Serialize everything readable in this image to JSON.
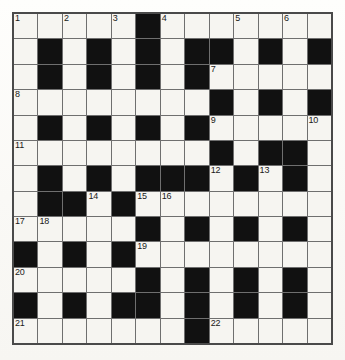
{
  "puzzle": {
    "type": "crossword-grid",
    "title": "Crossword puzzle grid",
    "columns": 13,
    "rows": 13,
    "cell_size_px": 24.6,
    "colors": {
      "block": "#111111",
      "open": "#f6f5f1",
      "grid_line": "#6f6f6f",
      "outer_border": "#4a4a4a",
      "number_text": "#1a1a1a",
      "page_background": "#fbfaf7"
    },
    "legend": {
      "block_symbol": "B",
      "open_symbol": "W"
    },
    "grid": [
      [
        "W",
        "W",
        "W",
        "W",
        "W",
        "B",
        "W",
        "W",
        "W",
        "W",
        "W",
        "W",
        "W"
      ],
      [
        "W",
        "B",
        "W",
        "B",
        "W",
        "B",
        "W",
        "B",
        "B",
        "W",
        "B",
        "W",
        "B"
      ],
      [
        "W",
        "B",
        "W",
        "B",
        "W",
        "B",
        "W",
        "B",
        "W",
        "W",
        "W",
        "W",
        "W"
      ],
      [
        "W",
        "W",
        "W",
        "W",
        "W",
        "W",
        "W",
        "W",
        "B",
        "W",
        "B",
        "W",
        "B"
      ],
      [
        "W",
        "B",
        "W",
        "B",
        "W",
        "B",
        "W",
        "B",
        "W",
        "W",
        "W",
        "W",
        "W"
      ],
      [
        "W",
        "W",
        "W",
        "W",
        "W",
        "W",
        "W",
        "W",
        "B",
        "W",
        "B",
        "B",
        "W"
      ],
      [
        "W",
        "B",
        "W",
        "B",
        "W",
        "B",
        "B",
        "B",
        "W",
        "B",
        "W",
        "B",
        "W"
      ],
      [
        "W",
        "B",
        "B",
        "W",
        "B",
        "W",
        "W",
        "W",
        "W",
        "W",
        "W",
        "W",
        "W"
      ],
      [
        "W",
        "W",
        "W",
        "W",
        "W",
        "B",
        "W",
        "B",
        "W",
        "B",
        "W",
        "B",
        "W"
      ],
      [
        "B",
        "W",
        "B",
        "W",
        "B",
        "W",
        "W",
        "W",
        "W",
        "W",
        "W",
        "W",
        "W"
      ],
      [
        "W",
        "W",
        "W",
        "W",
        "W",
        "B",
        "W",
        "B",
        "W",
        "B",
        "W",
        "B",
        "W"
      ],
      [
        "B",
        "W",
        "B",
        "W",
        "B",
        "B",
        "W",
        "B",
        "W",
        "B",
        "W",
        "B",
        "W"
      ],
      [
        "W",
        "W",
        "W",
        "W",
        "W",
        "W",
        "W",
        "B",
        "W",
        "W",
        "W",
        "W",
        "W"
      ]
    ],
    "numbers": [
      {
        "n": "1",
        "row": 0,
        "col": 0
      },
      {
        "n": "2",
        "row": 0,
        "col": 2
      },
      {
        "n": "3",
        "row": 0,
        "col": 4
      },
      {
        "n": "4",
        "row": 0,
        "col": 6
      },
      {
        "n": "5",
        "row": 0,
        "col": 9
      },
      {
        "n": "6",
        "row": 0,
        "col": 11
      },
      {
        "n": "7",
        "row": 2,
        "col": 8
      },
      {
        "n": "8",
        "row": 3,
        "col": 0
      },
      {
        "n": "9",
        "row": 4,
        "col": 8
      },
      {
        "n": "10",
        "row": 4,
        "col": 12
      },
      {
        "n": "11",
        "row": 5,
        "col": 0
      },
      {
        "n": "12",
        "row": 6,
        "col": 8
      },
      {
        "n": "13",
        "row": 6,
        "col": 10
      },
      {
        "n": "14",
        "row": 7,
        "col": 3
      },
      {
        "n": "15",
        "row": 7,
        "col": 5
      },
      {
        "n": "16",
        "row": 7,
        "col": 6
      },
      {
        "n": "17",
        "row": 8,
        "col": 0
      },
      {
        "n": "18",
        "row": 8,
        "col": 1
      },
      {
        "n": "19",
        "row": 9,
        "col": 5
      },
      {
        "n": "20",
        "row": 10,
        "col": 0
      },
      {
        "n": "21",
        "row": 12,
        "col": 0
      },
      {
        "n": "22",
        "row": 12,
        "col": 8
      }
    ],
    "entries": []
  }
}
